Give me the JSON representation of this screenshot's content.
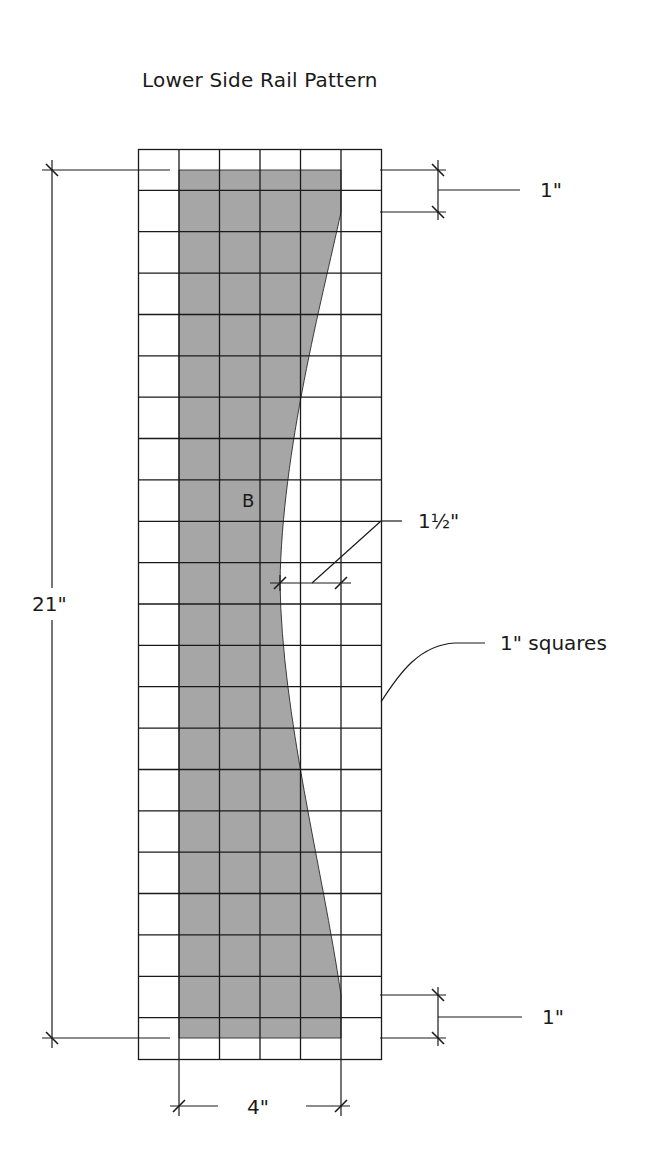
{
  "title": "Lower Side Rail Pattern",
  "piece_label": "B",
  "dimensions": {
    "overall_length": "21\"",
    "width": "4\"",
    "top_offset": "1\"",
    "bottom_offset": "1\"",
    "curve_depth": "1½\""
  },
  "grid_note": "1\" squares",
  "colors": {
    "piece_fill": "#a6a6a6",
    "line": "#1a1a1a",
    "background": "#ffffff"
  },
  "grid": {
    "columns": 6,
    "rows": 22,
    "square_size": "1\""
  }
}
